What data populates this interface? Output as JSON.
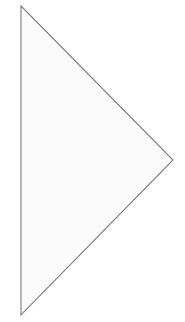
{
  "canvas": {
    "width": 185,
    "height": 322,
    "background_color": "#ffffff",
    "name": "shape-canvas"
  },
  "diagram": {
    "title": "",
    "type": "geometric-shape",
    "shapes": [
      {
        "name": "right-pointing-triangle",
        "kind": "triangle",
        "orientation": "pointing-right",
        "points": "21,6 173,160 21,315",
        "vertices": [
          {
            "label": "top-left",
            "x": 21,
            "y": 6
          },
          {
            "label": "right",
            "x": 173,
            "y": 160
          },
          {
            "label": "bottom-left",
            "x": 21,
            "y": 315
          }
        ],
        "fill_color": "#fbfbfb",
        "stroke_color": "#808080",
        "stroke_width": 1.1
      }
    ]
  }
}
